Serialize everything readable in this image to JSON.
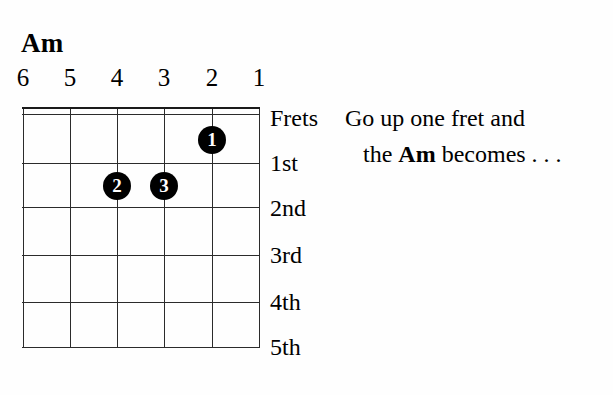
{
  "chord": {
    "name": "Am",
    "type": "guitar-chord-diagram"
  },
  "strings": {
    "labels": [
      "6",
      "5",
      "4",
      "3",
      "2",
      "1"
    ],
    "positions_px": [
      0,
      47,
      94,
      141,
      189,
      236
    ]
  },
  "frets": {
    "labels": [
      "Frets",
      "1st",
      "2nd",
      "3rd",
      "4th",
      "5th"
    ],
    "line_positions_px": [
      0,
      7,
      56,
      100,
      148,
      195,
      240
    ],
    "label_positions_px": [
      18,
      63,
      108,
      155,
      202,
      247
    ]
  },
  "fingers": [
    {
      "label": "1",
      "string": 2,
      "fret": 1,
      "x_px": 189,
      "y_px": 33
    },
    {
      "label": "2",
      "string": 4,
      "fret": 2,
      "x_px": 94,
      "y_px": 79
    },
    {
      "label": "3",
      "string": 3,
      "fret": 2,
      "x_px": 141,
      "y_px": 79
    }
  ],
  "caption": {
    "line1": "Go up one fret and",
    "line2_prefix": "the ",
    "line2_bold": "Am",
    "line2_suffix": " becomes . . ."
  },
  "colors": {
    "ink": "#000000",
    "grid": "#2b2b2b",
    "background": "#fefefe",
    "dot_fill": "#000000",
    "dot_text": "#ffffff"
  }
}
